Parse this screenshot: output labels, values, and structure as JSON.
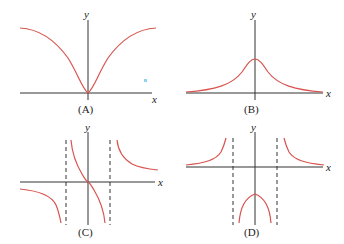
{
  "figure": {
    "colors": {
      "curve": "#d9534f",
      "axis": "#333333",
      "marker": "#8fd3f0"
    },
    "panels": [
      {
        "id": "A",
        "label": "(A)",
        "x_axis_label": "x",
        "y_axis_label": "y",
        "description": "even function with minimum 0 at origin, rising to horizontal asymptote on both sides"
      },
      {
        "id": "B",
        "label": "(B)",
        "x_axis_label": "x",
        "y_axis_label": "y",
        "description": "bell-shaped curve with maximum on y-axis, approaching 0 on both sides"
      },
      {
        "id": "C",
        "label": "(C)",
        "x_axis_label": "x",
        "y_axis_label": "y",
        "description": "odd function through origin with two vertical asymptotes"
      },
      {
        "id": "D",
        "label": "(D)",
        "x_axis_label": "x",
        "y_axis_label": "y",
        "description": "even function with two vertical asymptotes, negative inner arch, positive outer branches"
      }
    ]
  }
}
